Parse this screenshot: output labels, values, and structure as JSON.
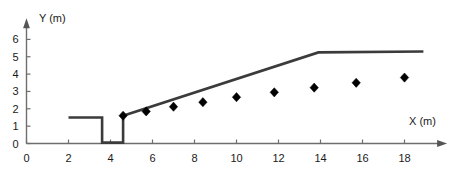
{
  "chart_data": {
    "type": "line",
    "title": "",
    "xlabel": "X (m)",
    "ylabel": "Y (m)",
    "xlim": [
      0,
      19.6
    ],
    "ylim": [
      0,
      6.7
    ],
    "xticks": [
      0,
      2,
      4,
      6,
      8,
      10,
      12,
      14,
      16,
      18
    ],
    "xtick_labels": [
      "0",
      "2",
      "4",
      "6",
      "8",
      "10",
      "12",
      "14",
      "16",
      "18"
    ],
    "yticks": [
      0,
      1,
      2,
      3,
      4,
      5,
      6
    ],
    "ytick_labels": [
      "0",
      "1",
      "2",
      "3",
      "4",
      "5",
      "6"
    ],
    "grid": false,
    "legend": null,
    "series": [
      {
        "name": "profile-line",
        "type": "line",
        "style": "solid",
        "color": "#3b3b3b",
        "points": [
          {
            "x": 2.0,
            "y": 1.5
          },
          {
            "x": 3.6,
            "y": 1.5
          },
          {
            "x": 3.6,
            "y": 0.05
          },
          {
            "x": 4.6,
            "y": 0.05
          },
          {
            "x": 4.6,
            "y": 1.6
          },
          {
            "x": 13.9,
            "y": 5.25
          },
          {
            "x": 18.9,
            "y": 5.3
          }
        ]
      },
      {
        "name": "measured-points",
        "type": "scatter",
        "marker": "diamond",
        "color": "#000000",
        "points": [
          {
            "x": 4.6,
            "y": 1.6
          },
          {
            "x": 5.7,
            "y": 1.85
          },
          {
            "x": 7.0,
            "y": 2.12
          },
          {
            "x": 8.4,
            "y": 2.38
          },
          {
            "x": 10.0,
            "y": 2.67
          },
          {
            "x": 11.8,
            "y": 2.95
          },
          {
            "x": 13.7,
            "y": 3.22
          },
          {
            "x": 15.7,
            "y": 3.5
          },
          {
            "x": 18.0,
            "y": 3.8
          }
        ]
      }
    ]
  },
  "axes": {
    "y_axis_label": "Y (m)",
    "x_axis_label": "X (m)"
  }
}
